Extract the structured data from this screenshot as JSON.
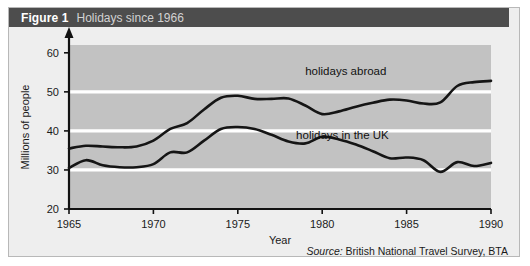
{
  "figure": {
    "label": "Figure 1",
    "caption": "Holidays since 1966"
  },
  "source": {
    "keyword": "Source:",
    "text": "British National Travel Survey, BTA"
  },
  "chart_data": {
    "type": "line",
    "title": "Holidays since 1966",
    "xlabel": "Year",
    "ylabel": "Millions of people",
    "xlim": [
      1965,
      1990
    ],
    "ylim": [
      20,
      62
    ],
    "xticks": [
      1965,
      1970,
      1975,
      1980,
      1985,
      1990
    ],
    "yticks": [
      20,
      30,
      40,
      50,
      60
    ],
    "gridlines": [
      30,
      40,
      50
    ],
    "grid": true,
    "legend_position": "inline-annotations",
    "x": [
      1965,
      1966,
      1967,
      1968,
      1969,
      1970,
      1971,
      1972,
      1973,
      1974,
      1975,
      1976,
      1977,
      1978,
      1979,
      1980,
      1981,
      1982,
      1983,
      1984,
      1985,
      1986,
      1987,
      1988,
      1989,
      1990
    ],
    "series": [
      {
        "name": "holidays abroad",
        "values": [
          35.5,
          36.2,
          36.0,
          35.8,
          36.0,
          37.5,
          40.5,
          42.0,
          45.5,
          48.5,
          49.0,
          48.2,
          48.2,
          48.3,
          46.5,
          44.3,
          45.0,
          46.2,
          47.2,
          48.0,
          47.8,
          47.0,
          47.3,
          51.5,
          52.5,
          52.8
        ]
      },
      {
        "name": "holidays in the UK",
        "values": [
          30.5,
          32.5,
          31.2,
          30.7,
          30.7,
          31.5,
          34.5,
          34.5,
          37.5,
          40.5,
          41.0,
          40.5,
          39.0,
          37.3,
          36.8,
          38.5,
          37.8,
          36.5,
          34.8,
          33.0,
          33.2,
          32.5,
          29.5,
          32.0,
          31.0,
          31.8
        ]
      }
    ],
    "annotations": [
      {
        "text": "holidays abroad",
        "x": 1981.4,
        "y": 54.2
      },
      {
        "text": "holidays in the UK",
        "x": 1981.2,
        "y": 37.8
      }
    ]
  }
}
